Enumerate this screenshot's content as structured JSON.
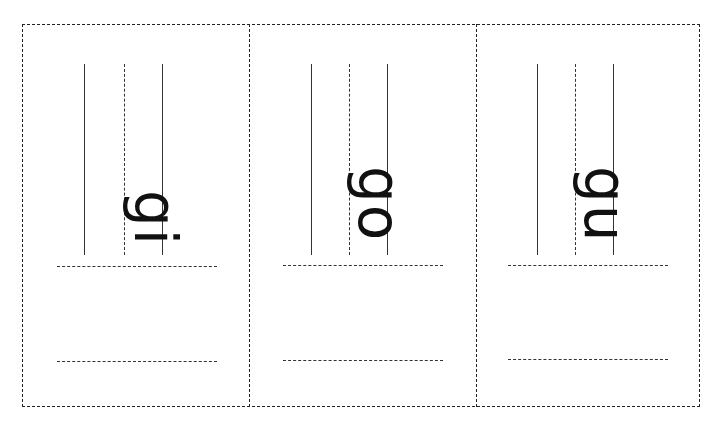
{
  "worksheet": {
    "cards": [
      {
        "word": "gi"
      },
      {
        "word": "go"
      },
      {
        "word": "gu"
      }
    ],
    "line_color": "#222222",
    "text_color": "#111111",
    "orientation": "rotated 90deg clockwise"
  }
}
